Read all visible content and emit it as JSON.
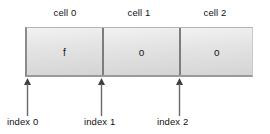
{
  "diagram": {
    "title_visible": false,
    "type": "string-cell-index-diagram",
    "cells": [
      {
        "label": "cell 0",
        "value": "f",
        "index_label": "index 0",
        "index": 0
      },
      {
        "label": "cell 1",
        "value": "o",
        "index_label": "index 1",
        "index": 1
      },
      {
        "label": "cell 2",
        "value": "o",
        "index_label": "index 2",
        "index": 2
      }
    ],
    "arrow_icon_name": "up-arrow-icon",
    "colors": {
      "background": "#ffffff",
      "cell_fill_light": "#f2f2f2",
      "cell_fill_dark": "#d4d4d4",
      "divider": "#7d7d7d",
      "border": "#8c8c8c",
      "text": "#111111",
      "arrow": "#4a4a4a"
    }
  }
}
